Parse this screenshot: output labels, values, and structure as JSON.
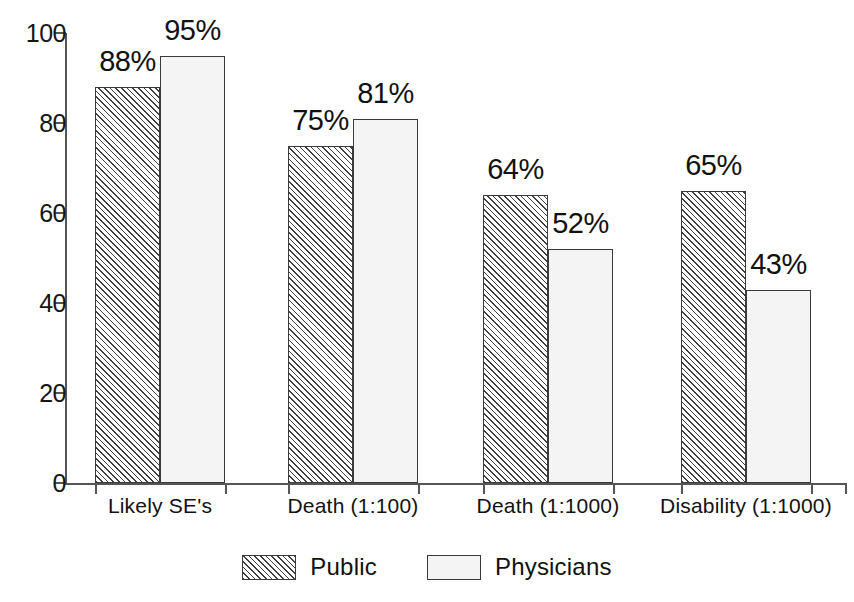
{
  "chart_data": {
    "type": "bar",
    "title": "",
    "subtitle": "",
    "xlabel": "",
    "ylabel": "",
    "ylim": [
      0,
      100
    ],
    "yticks": [
      0,
      20,
      40,
      60,
      80,
      100
    ],
    "ytick_labels": [
      "0",
      "20",
      "40",
      "60",
      "80",
      "100"
    ],
    "grid": false,
    "legend_position": "bottom-center",
    "categories": [
      "Likely SE's",
      "Death (1:100)",
      "Death (1:1000)",
      "Disability (1:1000)"
    ],
    "series": [
      {
        "name": "Public",
        "fill": "diagonal-hatch",
        "color": "#d9d9d9",
        "values": [
          88,
          75,
          64,
          65
        ],
        "value_labels": [
          "88%",
          "75%",
          "64%",
          "65%"
        ]
      },
      {
        "name": "Physicians",
        "fill": "solid-light",
        "color": "#f4f4f4",
        "values": [
          95,
          81,
          52,
          43
        ],
        "value_labels": [
          "95%",
          "81%",
          "52%",
          "43%"
        ]
      }
    ]
  },
  "axis": {
    "y_ticks": [
      {
        "label": "100",
        "value": 100
      },
      {
        "label": "80",
        "value": 80
      },
      {
        "label": "60",
        "value": 60
      },
      {
        "label": "40",
        "value": 40
      },
      {
        "label": "20",
        "value": 20
      },
      {
        "label": "0",
        "value": 0
      }
    ]
  },
  "legend": {
    "entries": [
      {
        "label": "Public",
        "style": "public"
      },
      {
        "label": "Physicians",
        "style": "physicians"
      }
    ]
  },
  "colors": {
    "axis": "#555555",
    "bar_outline": "#3a3a3a",
    "public_fill": "#d9d9d9",
    "physicians_fill": "#f4f4f4",
    "text": "#111111",
    "background": "#ffffff"
  }
}
